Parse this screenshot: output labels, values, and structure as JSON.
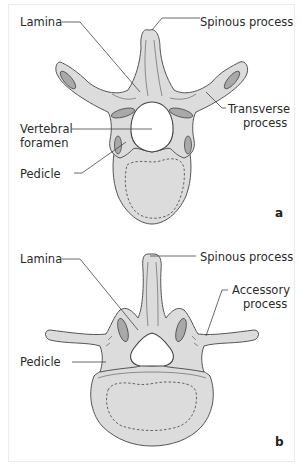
{
  "figure": {
    "panels": [
      {
        "id": "a",
        "panel_label": "a",
        "view": "superior view of thoracic vertebra",
        "labels": {
          "lamina": "Lamina",
          "spinous_process": "Spinous process",
          "transverse_process_line1": "Transverse",
          "transverse_process_line2": "process",
          "vertebral_foramen_line1": "Vertebral",
          "vertebral_foramen_line2": "foramen",
          "pedicle": "Pedicle"
        }
      },
      {
        "id": "b",
        "panel_label": "b",
        "view": "superior view of lumbar vertebra",
        "labels": {
          "lamina": "Lamina",
          "spinous_process": "Spinous process",
          "accessory_process_line1": "Accessory",
          "accessory_process_line2": "process",
          "pedicle": "Pedicle"
        }
      }
    ],
    "colors": {
      "bone_fill": "#dcdcdc",
      "facet_fill": "#a9a9a9",
      "outline": "#555555",
      "text": "#2a2a2a",
      "background": "#ffffff"
    }
  }
}
